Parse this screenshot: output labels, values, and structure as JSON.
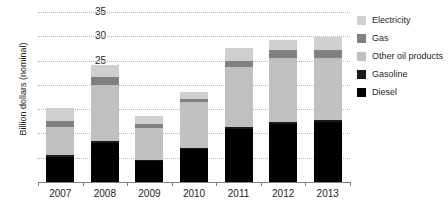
{
  "chart_data": {
    "type": "bar",
    "subtype": "stacked-vertical",
    "title": "",
    "xlabel": "",
    "ylabel": "Billion dollars (nominal)",
    "categories": [
      "2007",
      "2008",
      "2009",
      "2010",
      "2011",
      "2012",
      "2013"
    ],
    "ylim": [
      0,
      35
    ],
    "yticks": [
      0,
      5,
      10,
      15,
      20,
      25,
      30,
      35
    ],
    "ytick_labels": [
      "",
      "5",
      "10",
      "15",
      "20",
      "25",
      "30",
      "35"
    ],
    "grid": true,
    "grid_axis": "y",
    "legend_position": "right",
    "series": [
      {
        "name": "Diesel",
        "color": "#000000",
        "values": [
          5.2,
          8.0,
          4.4,
          6.8,
          11.0,
          12.0,
          12.4
        ]
      },
      {
        "name": "Gasoline",
        "color": "#1a1a1a",
        "values": [
          0.3,
          0.4,
          0.2,
          0.3,
          0.4,
          0.4,
          0.4
        ]
      },
      {
        "name": "Other oil products",
        "color": "#c0c0c0",
        "values": [
          5.9,
          11.6,
          6.5,
          9.4,
          12.3,
          13.1,
          12.8
        ]
      },
      {
        "name": "Gas",
        "color": "#808080",
        "values": [
          1.1,
          1.6,
          0.8,
          0.6,
          1.3,
          1.6,
          1.6
        ]
      },
      {
        "name": "Electricity",
        "color": "#cfcfcf",
        "values": [
          2.8,
          2.5,
          1.7,
          1.5,
          2.5,
          2.2,
          2.6
        ]
      }
    ],
    "totals": [
      15.3,
      24.1,
      13.6,
      18.6,
      27.5,
      29.3,
      29.8
    ]
  },
  "legend": {
    "items": [
      {
        "label": "Electricity",
        "color": "#cfcfcf"
      },
      {
        "label": "Gas",
        "color": "#808080"
      },
      {
        "label": "Other oil products",
        "color": "#c0c0c0"
      },
      {
        "label": "Gasoline",
        "color": "#1a1a1a"
      },
      {
        "label": "Diesel",
        "color": "#000000"
      }
    ]
  }
}
